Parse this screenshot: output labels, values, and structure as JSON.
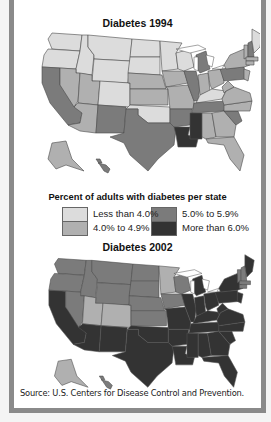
{
  "maps": [
    {
      "title": "Diabetes 1994",
      "classes": {
        "WA": 1,
        "OR": 1,
        "ID": 1,
        "MT": 1,
        "WY": 1,
        "ND": 1,
        "SD": 1,
        "MN": 1,
        "WI": 1,
        "CO": 1,
        "OK": 1,
        "KY": 1,
        "ME": 1,
        "CA": 3,
        "NV": 2,
        "UT": 2,
        "AZ": 2,
        "NM": 3,
        "TX": 3,
        "NE": 2,
        "KS": 2,
        "IA": 2,
        "MO": 2,
        "IL": 3,
        "MI": 3,
        "IN": 2,
        "OH": 2,
        "PA": 3,
        "NY": 2,
        "VT": 2,
        "NH": 3,
        "MA": 2,
        "CT": 2,
        "NJ": 2,
        "WV": 2,
        "VA": 2,
        "NC": 2,
        "TN": 3,
        "AR": 3,
        "LA": 4,
        "MS": 4,
        "AL": 2,
        "GA": 2,
        "SC": 3,
        "FL": 2,
        "AK": 2,
        "HI": 3
      }
    },
    {
      "title": "Diabetes 2002",
      "classes": {
        "WA": 3,
        "OR": 3,
        "ID": 3,
        "MT": 3,
        "WY": 3,
        "ND": 3,
        "SD": 3,
        "NE": 3,
        "KS": 3,
        "IA": 3,
        "WI": 3,
        "MN": 2,
        "NV": 3,
        "UT": 2,
        "CO": 2,
        "CA": 4,
        "AZ": 4,
        "NM": 4,
        "TX": 4,
        "OK": 4,
        "MO": 4,
        "AR": 4,
        "LA": 4,
        "IL": 4,
        "MI": 4,
        "IN": 4,
        "OH": 4,
        "KY": 4,
        "TN": 4,
        "MS": 4,
        "AL": 4,
        "GA": 4,
        "FL": 4,
        "SC": 4,
        "NC": 4,
        "VA": 4,
        "WV": 4,
        "PA": 4,
        "NY": 4,
        "NJ": 4,
        "VT": 3,
        "NH": 3,
        "MA": 3,
        "CT": 3,
        "ME": 4,
        "AK": 2,
        "HI": 3
      }
    }
  ],
  "legend": {
    "title": "Percent of adults with diabetes per state",
    "items": [
      {
        "label": "Less than 4.0%",
        "color": "#dcdcdc"
      },
      {
        "label": "4.0% to 4.9%",
        "color": "#b0b0b0"
      },
      {
        "label": "5.0% to 5.9%",
        "color": "#7b7b7b"
      },
      {
        "label": "More than 6.0%",
        "color": "#333333"
      }
    ]
  },
  "source": "Source: U.S. Centers for Disease Control and Prevention."
}
